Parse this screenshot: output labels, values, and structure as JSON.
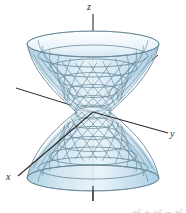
{
  "figure": {
    "name": "hyperboloid-of-one-sheet",
    "caption_fragment": "x² + y² − z²",
    "background_color": "#ffffff",
    "surface": {
      "fill_light": "#dcecf5",
      "fill_mid": "#bcd9e8",
      "fill_dark": "#9cc6dd",
      "mesh_color": "#5c7f90",
      "mesh_accent": "#8a9aa6",
      "outline_color": "#6a8a9a"
    },
    "axes": {
      "line_color": "#2b2b2b",
      "z": {
        "label": "z",
        "x": 87,
        "y": 2
      },
      "y": {
        "label": "y",
        "x": 170,
        "y": 129
      },
      "x": {
        "label": "x",
        "x": 6,
        "y": 172
      }
    },
    "geometry": {
      "center_x": 93,
      "center_y": 112,
      "top_rim_y": 44,
      "bottom_rim_y": 178,
      "rim_radius_x": 66,
      "rim_radius_y": 13,
      "waist_radius_x": 17,
      "waist_radius_y": 5,
      "n_ruling_lines": 28,
      "n_latitude_rings": 7
    }
  }
}
